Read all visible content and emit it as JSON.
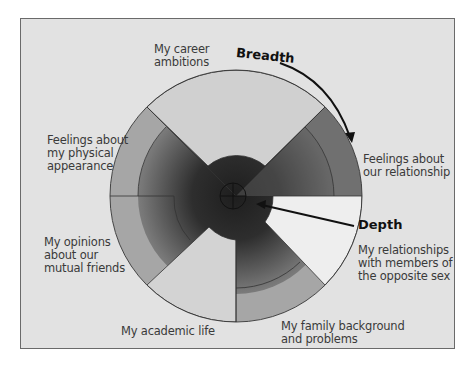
{
  "diagram": {
    "title": "",
    "concept_labels": {
      "breadth": "Breadth",
      "depth": "Depth"
    },
    "topics": [
      {
        "id": "career",
        "label": "My career\nambitions",
        "shade": "light"
      },
      {
        "id": "relationship",
        "label": "Feelings about\nour relationship",
        "shade": "dark"
      },
      {
        "id": "opposite_sex",
        "label": "My relationships\nwith members of\nthe opposite sex",
        "shade": "white"
      },
      {
        "id": "family",
        "label": "My family background\nand problems",
        "shade": "medium"
      },
      {
        "id": "academic",
        "label": "My academic life",
        "shade": "light"
      },
      {
        "id": "friends",
        "label": "My opinions\nabout our\nmutual friends",
        "shade": "medium"
      },
      {
        "id": "appearance",
        "label": "Feelings about\nmy physical\nappearance",
        "shade": "medium-light"
      }
    ],
    "colors": {
      "background": "#e2e2e2",
      "frame_border": "#6a6a6a",
      "light_wedge": "#d2d2d2",
      "white_wedge": "#efefef",
      "outer_ring_medium": "#a8a8a8",
      "outer_ring_dark": "#6e6e6e",
      "core_dark": "#2a2a2a",
      "stroke": "#333333",
      "text": "#3a3a3a"
    }
  }
}
